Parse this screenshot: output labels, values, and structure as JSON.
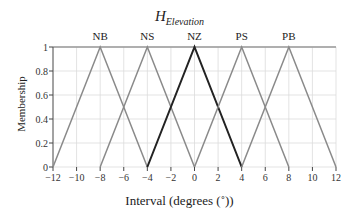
{
  "chart_data": {
    "type": "line",
    "title_main": "H",
    "title_sub": "Elevation",
    "xlabel": "Interval (degrees (˚))",
    "ylabel": "Membership",
    "xlim": [
      -12,
      12
    ],
    "ylim": [
      0,
      1
    ],
    "xticks": [
      -12,
      -10,
      -8,
      -6,
      -4,
      -2,
      0,
      2,
      4,
      6,
      8,
      10,
      12
    ],
    "xtick_labels": [
      "−12",
      "−10",
      "−8",
      "−6",
      "−4",
      "−2",
      "0",
      "2",
      "4",
      "6",
      "8",
      "10",
      "12"
    ],
    "yticks": [
      0,
      0.2,
      0.4,
      0.6,
      0.8,
      1
    ],
    "ytick_labels": [
      "0",
      "0.2",
      "0.4",
      "0.6",
      "0.8",
      "1"
    ],
    "grid": true,
    "series": [
      {
        "name": "NB",
        "x": [
          -12,
          -8,
          -4
        ],
        "y": [
          0,
          1,
          0
        ],
        "color": "#8a8a8a",
        "width": 1.5
      },
      {
        "name": "NS",
        "x": [
          -8,
          -4,
          0
        ],
        "y": [
          0,
          1,
          0
        ],
        "color": "#8a8a8a",
        "width": 1.5
      },
      {
        "name": "NZ",
        "x": [
          -4,
          0,
          4
        ],
        "y": [
          0,
          1,
          0
        ],
        "color": "#222222",
        "width": 2
      },
      {
        "name": "PS",
        "x": [
          0,
          4,
          8
        ],
        "y": [
          0,
          1,
          0
        ],
        "color": "#8a8a8a",
        "width": 1.5
      },
      {
        "name": "PB",
        "x": [
          4,
          8,
          12
        ],
        "y": [
          0,
          1,
          0
        ],
        "color": "#8a8a8a",
        "width": 1.5
      }
    ]
  }
}
